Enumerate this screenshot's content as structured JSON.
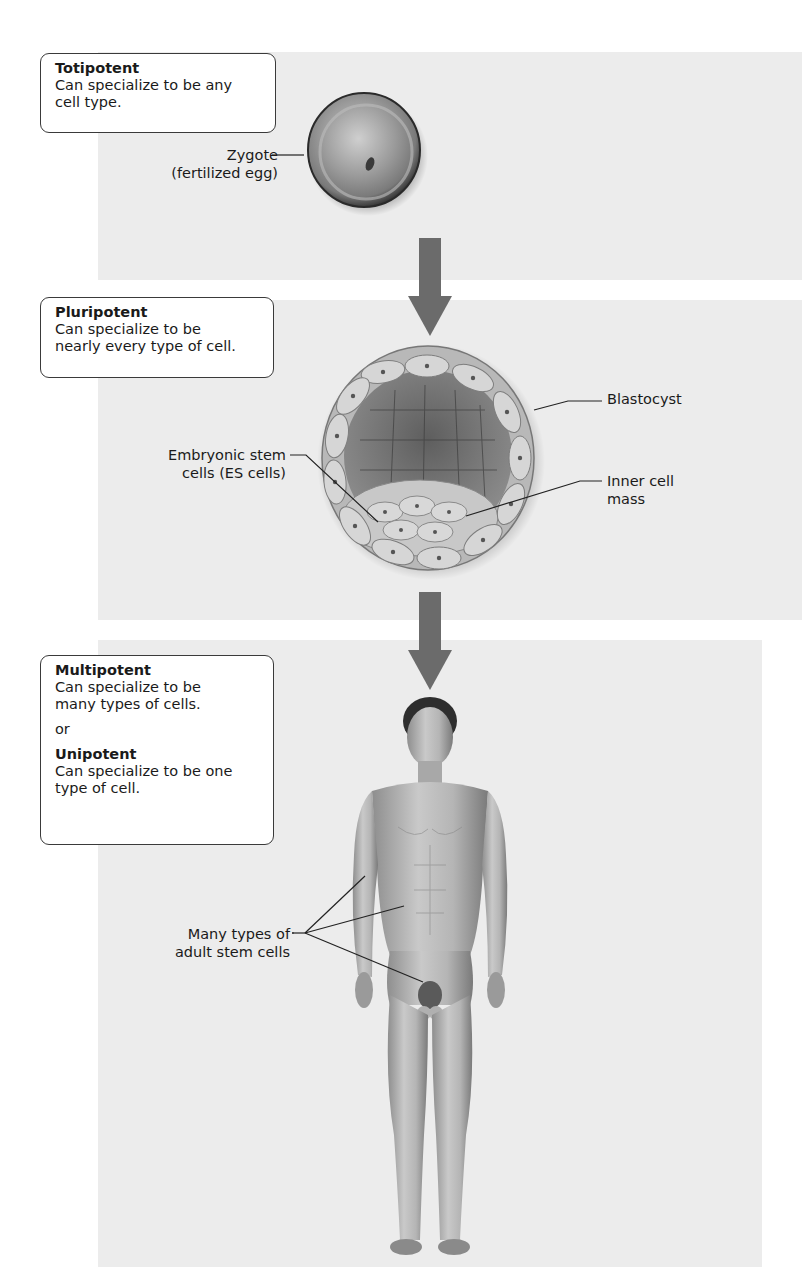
{
  "stages": [
    {
      "title": "Totipotent",
      "description": "Can specialize to be any cell type.",
      "description_lines": [
        "Can specialize to be any",
        "cell type."
      ],
      "illustration": "zygote",
      "annotations": [
        {
          "lines": [
            "Zygote",
            "(fertilized egg)"
          ]
        }
      ]
    },
    {
      "title": "Pluripotent",
      "description_lines": [
        "Can specialize to be",
        "nearly every type of cell."
      ],
      "illustration": "blastocyst",
      "annotations": [
        {
          "lines": [
            "Blastocyst"
          ]
        },
        {
          "lines": [
            "Embryonic stem",
            "cells (ES cells)"
          ]
        },
        {
          "lines": [
            "Inner cell",
            "mass"
          ]
        }
      ]
    },
    {
      "title": "Multipotent",
      "description_lines": [
        "Can specialize to be",
        "many types of cells."
      ],
      "connector": "or",
      "alt_title": "Unipotent",
      "alt_description_lines": [
        "Can specialize to be one",
        "type of cell."
      ],
      "illustration": "adult-human-figure",
      "annotations": [
        {
          "lines": [
            "Many types of",
            "adult stem cells"
          ]
        }
      ]
    }
  ],
  "arrows": [
    {
      "from": "Totipotent",
      "to": "Pluripotent",
      "icon": "down-arrow-icon",
      "color": "#6b6b6b"
    },
    {
      "from": "Pluripotent",
      "to": "Multipotent",
      "icon": "down-arrow-icon",
      "color": "#6b6b6b"
    }
  ],
  "colors": {
    "panel_bg": "#ececec",
    "box_border": "#3a3a3a",
    "arrow": "#6b6b6b",
    "leader_line": "#222222"
  }
}
